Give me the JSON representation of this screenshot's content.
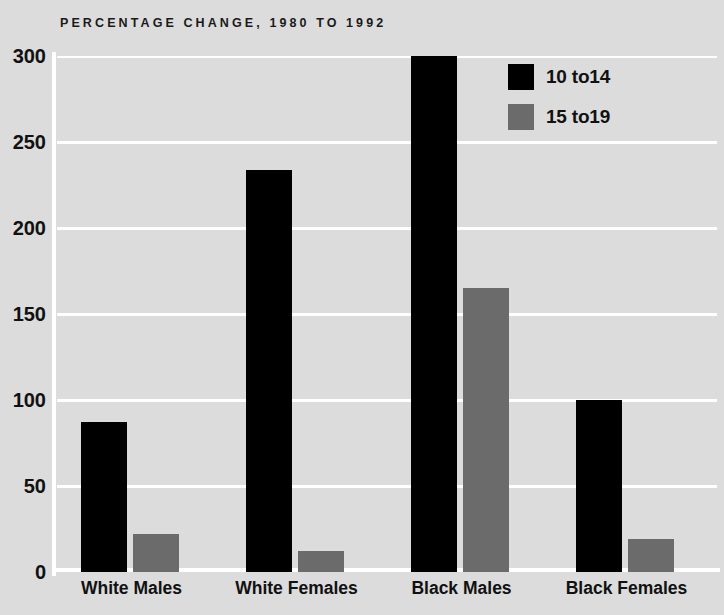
{
  "chart_data": {
    "type": "bar",
    "title": "PERCENTAGE CHANGE, 1980 TO 1992",
    "xlabel": "",
    "ylabel": "",
    "ylim": [
      0,
      300
    ],
    "yticks": [
      0,
      50,
      100,
      150,
      200,
      250,
      300
    ],
    "ytick_labels": [
      "0",
      "50",
      "100",
      "150",
      "200",
      "250",
      "300"
    ],
    "grid": true,
    "legend_position": "top-right",
    "categories": [
      "White Males",
      "White Females",
      "Black Males",
      "Black Females"
    ],
    "series": [
      {
        "name": "10 to14",
        "color": "#000000",
        "values": [
          87,
          234,
          305,
          100
        ],
        "clipped": [
          false,
          false,
          true,
          false
        ]
      },
      {
        "name": "15 to19",
        "color": "#6b6b6b",
        "values": [
          22,
          12,
          165,
          19
        ],
        "clipped": [
          false,
          false,
          false,
          false
        ]
      }
    ],
    "background_color": "#dcdcdc",
    "gridline_color": "#ffffff",
    "text_color": "#111111"
  }
}
